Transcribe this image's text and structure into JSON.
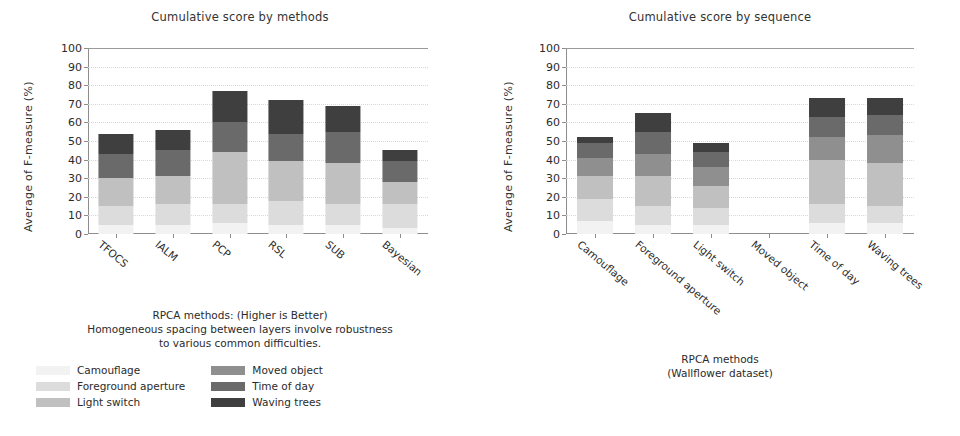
{
  "figure": {
    "background": "#ffffff",
    "axis_color": "#8d8d8d",
    "grid_color": "#d8d8d8"
  },
  "palette": {
    "camouflage": "#f2f2f2",
    "foreground_aperture": "#dcdcdc",
    "light_switch": "#c0c0c0",
    "moved_object": "#8f8f8f",
    "time_of_day": "#6a6a6a",
    "waving_trees": "#3f3f3f",
    "tfocs": "#f2f2f2",
    "ialm": "#dcdcdc",
    "pcp": "#c0c0c0",
    "rsl": "#8f8f8f",
    "sub": "#6a6a6a",
    "bayesian": "#3f3f3f"
  },
  "left_panel": {
    "title": "Cumulative score by methods",
    "ylabel": "Average  of  F-measure  (%)",
    "caption_line_1": "RPCA methods: (Higher is Better)",
    "caption_line_2": "Homogeneous spacing between layers involve robustness",
    "caption_line_3": "to various common difficulties.",
    "legend": {
      "column_1": [
        {
          "label": "Camouflage",
          "color_key": "camouflage"
        },
        {
          "label": "Foreground aperture",
          "color_key": "foreground_aperture"
        },
        {
          "label": "Light switch",
          "color_key": "light_switch"
        }
      ],
      "column_2": [
        {
          "label": "Moved object",
          "color_key": "moved_object"
        },
        {
          "label": "Time of day",
          "color_key": "time_of_day"
        },
        {
          "label": "Waving trees",
          "color_key": "waving_trees"
        }
      ]
    }
  },
  "right_panel": {
    "title": "Cumulative score by sequence",
    "ylabel": "Average  of  F-measure  (%)",
    "caption_line_1": "RPCA methods",
    "caption_line_2": "(Wallflower dataset)",
    "legend": {
      "column_1": [
        {
          "label": "TFOCS",
          "color_key": "tfocs"
        },
        {
          "label": "IALM",
          "color_key": "ialm"
        }
      ],
      "column_2": [
        {
          "label": "PCP",
          "color_key": "pcp"
        },
        {
          "label": "RSL",
          "color_key": "rsl"
        }
      ],
      "column_3": [
        {
          "label": "SUB",
          "color_key": "sub"
        },
        {
          "label": "Bayesian",
          "color_key": "bayesian"
        }
      ]
    }
  },
  "chart_data": [
    {
      "type": "bar",
      "stacked": true,
      "title": "Cumulative score by methods",
      "xlabel": "",
      "ylabel": "Average  of  F-measure  (%)",
      "ylim": [
        0,
        100
      ],
      "yticks": [
        0,
        10,
        20,
        30,
        40,
        50,
        60,
        70,
        80,
        90,
        100
      ],
      "grid": true,
      "legend_position": "below",
      "categories": [
        "TFOCS",
        "IALM",
        "PCP",
        "RSL",
        "SUB",
        "Bayesian"
      ],
      "series": [
        {
          "name": "Camouflage",
          "values": [
            5,
            5,
            6,
            5,
            5,
            3
          ]
        },
        {
          "name": "Foreground aperture",
          "values": [
            10,
            11,
            10,
            13,
            11,
            13
          ]
        },
        {
          "name": "Light switch",
          "values": [
            15,
            15,
            28,
            21,
            22,
            12
          ]
        },
        {
          "name": "Moved object",
          "values": [
            0,
            0,
            0,
            0,
            0,
            0
          ]
        },
        {
          "name": "Time of day",
          "values": [
            13,
            14,
            16,
            15,
            17,
            11
          ]
        },
        {
          "name": "Waving trees",
          "values": [
            11,
            11,
            17,
            18,
            14,
            6
          ]
        }
      ],
      "totals": [
        54,
        56,
        77,
        72,
        69,
        45
      ]
    },
    {
      "type": "bar",
      "stacked": true,
      "title": "Cumulative score by sequence",
      "xlabel": "",
      "ylabel": "Average  of  F-measure  (%)",
      "ylim": [
        0,
        100
      ],
      "yticks": [
        0,
        10,
        20,
        30,
        40,
        50,
        60,
        70,
        80,
        90,
        100
      ],
      "grid": true,
      "legend_position": "below",
      "categories": [
        "Camouflage",
        "Foreground aperture",
        "Light switch",
        "Moved object",
        "Time of day",
        "Waving trees"
      ],
      "series": [
        {
          "name": "TFOCS",
          "values": [
            7,
            5,
            5,
            0,
            6,
            6
          ]
        },
        {
          "name": "IALM",
          "values": [
            12,
            10,
            9,
            0,
            10,
            9
          ]
        },
        {
          "name": "PCP",
          "values": [
            12,
            16,
            12,
            0,
            24,
            23
          ]
        },
        {
          "name": "RSL",
          "values": [
            10,
            12,
            10,
            0,
            12,
            15
          ]
        },
        {
          "name": "SUB",
          "values": [
            8,
            12,
            8,
            0,
            11,
            11
          ]
        },
        {
          "name": "Bayesian",
          "values": [
            3,
            10,
            5,
            0,
            10,
            9
          ]
        }
      ],
      "totals": [
        52,
        65,
        49,
        0,
        73,
        73
      ]
    }
  ]
}
